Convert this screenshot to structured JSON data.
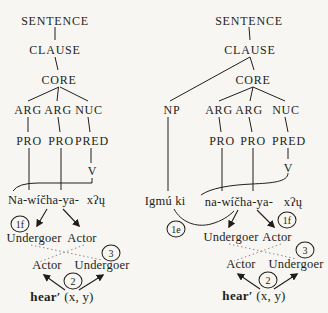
{
  "palette": {
    "background": "#f8f6f2",
    "ink": "#211e1a",
    "dotted_line": "#8a8a8a"
  },
  "trees": {
    "left": {
      "nodes": {
        "sentence": "SENTENCE",
        "clause": "CLAUSE",
        "core": "CORE",
        "arg1": "ARG",
        "arg2": "ARG",
        "nuc": "NUC",
        "pro1": "PRO",
        "pro2": "PRO",
        "pred": "PRED",
        "v": "V"
      },
      "words": {
        "prefix_complex": "Na-wíčha-ya-",
        "verb_root": "xʔų"
      },
      "macroroles": {
        "undergoer_top": "Undergoer",
        "actor_top": "Actor",
        "actor_bottom": "Actor",
        "undergoer_bottom": "Undergoer"
      },
      "logical_structure": {
        "predicate": "hear",
        "prime": "′",
        "arguments": "(x, y)"
      },
      "steps": {
        "f": "1f",
        "two": "2",
        "three": "3"
      }
    },
    "right": {
      "nodes": {
        "sentence": "SENTENCE",
        "clause": "CLAUSE",
        "core": "CORE",
        "np": "NP",
        "arg1": "ARG",
        "arg2": "ARG",
        "nuc": "NUC",
        "pro1": "PRO",
        "pro2": "PRO",
        "pred": "PRED",
        "v": "V"
      },
      "words": {
        "np_word": "Igmú ki",
        "prefix_complex": "na-wíčha-ya-",
        "verb_root": "xʔų"
      },
      "macroroles": {
        "undergoer_top": "Undergoer",
        "actor_top": "Actor",
        "actor_bottom": "Actor",
        "undergoer_bottom": "Undergoer"
      },
      "logical_structure": {
        "predicate": "hear",
        "prime": "′",
        "arguments": "(x, y)"
      },
      "steps": {
        "e": "1e",
        "f": "1f",
        "two": "2",
        "three": "3"
      }
    }
  }
}
